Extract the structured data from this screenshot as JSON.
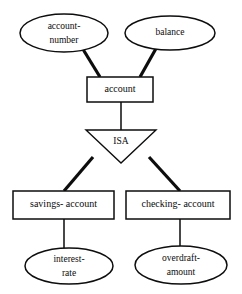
{
  "diagram": {
    "type": "er-diagram",
    "colors": {
      "background": "#ffffff",
      "stroke": "#0d0d0d",
      "text": "#0b0b0b",
      "fill": "#ffffff"
    },
    "entities": [
      {
        "id": "account",
        "label": "account",
        "shape": "rectangle",
        "role": "superclass",
        "x": 87,
        "y": 77,
        "width": 66,
        "height": 25
      },
      {
        "id": "savings-account",
        "label": "savings- account",
        "shape": "rectangle",
        "role": "subclass",
        "x": 13,
        "y": 191,
        "width": 101,
        "height": 28
      },
      {
        "id": "checking-account",
        "label": "checking- account",
        "shape": "rectangle",
        "role": "subclass",
        "x": 126,
        "y": 191,
        "width": 104,
        "height": 28
      }
    ],
    "attributes": [
      {
        "id": "account-number",
        "label": "account-number",
        "lines": [
          "account-",
          "number"
        ],
        "shape": "ellipse",
        "owner": "account",
        "cx": 64,
        "cy": 33,
        "rx": 44,
        "ry": 19
      },
      {
        "id": "balance",
        "label": "balance",
        "lines": [
          "balance"
        ],
        "shape": "ellipse",
        "owner": "account",
        "cx": 170,
        "cy": 33,
        "rx": 45,
        "ry": 17
      },
      {
        "id": "interest-rate",
        "label": "interest-rate",
        "lines": [
          "interest-",
          "rate"
        ],
        "shape": "ellipse",
        "owner": "savings-account",
        "cx": 69,
        "cy": 266,
        "rx": 44,
        "ry": 18
      },
      {
        "id": "overdraft-amount",
        "label": "overdraft-amount",
        "lines": [
          "overdraft-",
          "amount"
        ],
        "shape": "ellipse",
        "owner": "checking-account",
        "cx": 181,
        "cy": 265,
        "rx": 46,
        "ry": 19
      }
    ],
    "relationships": [
      {
        "id": "isa",
        "label": "ISA",
        "shape": "triangle-down",
        "superclass": "account",
        "subclasses": [
          "savings-account",
          "checking-account"
        ],
        "left_x": 86,
        "right_x": 156,
        "top_y": 130,
        "apex_x": 121,
        "apex_y": 163
      }
    ],
    "edges": [
      {
        "id": "edge-account-number-to-account",
        "from": "account-number",
        "to": "account",
        "style": "thick",
        "x1": 81,
        "y1": 46,
        "x2": 100,
        "y2": 77
      },
      {
        "id": "edge-balance-to-account",
        "from": "balance",
        "to": "account",
        "style": "thick",
        "x1": 158,
        "y1": 45,
        "x2": 140,
        "y2": 77
      },
      {
        "id": "edge-account-to-isa",
        "from": "account",
        "to": "isa",
        "style": "thin",
        "x1": 121,
        "y1": 102,
        "x2": 121,
        "y2": 130
      },
      {
        "id": "edge-isa-to-savings-account",
        "from": "isa",
        "to": "savings-account",
        "style": "thick",
        "x1": 93,
        "y1": 157,
        "x2": 64,
        "y2": 191
      },
      {
        "id": "edge-isa-to-checking-account",
        "from": "isa",
        "to": "checking-account",
        "style": "thick",
        "x1": 149,
        "y1": 157,
        "x2": 180,
        "y2": 191
      },
      {
        "id": "edge-savings-account-to-interest-rate",
        "from": "savings-account",
        "to": "interest-rate",
        "style": "thin",
        "x1": 64,
        "y1": 219,
        "x2": 64,
        "y2": 249
      },
      {
        "id": "edge-checking-account-to-overdraft-amount",
        "from": "checking-account",
        "to": "overdraft-amount",
        "style": "thin",
        "x1": 180,
        "y1": 219,
        "x2": 180,
        "y2": 247
      }
    ]
  }
}
